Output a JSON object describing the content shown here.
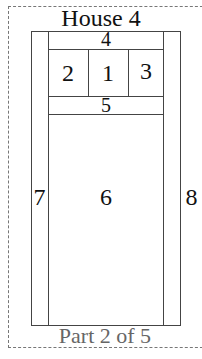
{
  "title": "House 4",
  "footer": "Part 2 of 5",
  "regions": {
    "r1": "1",
    "r2": "2",
    "r3": "3",
    "r4": "4",
    "r5": "5",
    "r6": "6",
    "r7": "7",
    "r8": "8"
  },
  "colors": {
    "line": "#444444",
    "text": "#111111",
    "footer_text": "#666666",
    "dashed_border": "#777777"
  }
}
